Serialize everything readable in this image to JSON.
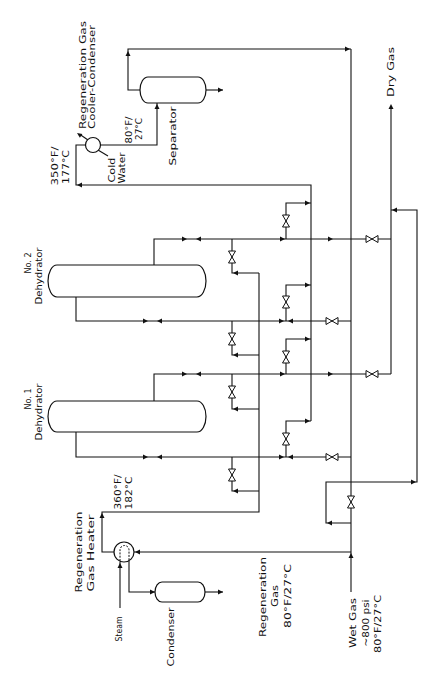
{
  "figure": {
    "background_color": "#ffffff",
    "line_color": "#111111"
  },
  "equipment": {
    "dehydrator_2": {
      "number": "No. 2",
      "name": "Dehydrator"
    },
    "dehydrator_1": {
      "number": "No. 1",
      "name": "Dehydrator"
    },
    "heater": {
      "line1": "Regeneration",
      "line2": "Gas Heater"
    },
    "cooler_condenser": {
      "line1": "Regeneration Gas",
      "line2": "Cooler-Condenser"
    },
    "separator": {
      "label": "Separator"
    },
    "condenser": {
      "label": "Condenser"
    }
  },
  "streams": {
    "wet_gas": {
      "name": "Wet Gas",
      "pressure": "~800 psi",
      "temperature": "80°F/27°C"
    },
    "regeneration_gas": {
      "line1": "Regeneration",
      "line2": "Gas",
      "temperature": "80°F/27°C"
    },
    "dry_gas": {
      "name": "Dry Gas"
    },
    "steam": {
      "name": "Steam"
    },
    "cold_water": {
      "line1": "Cold",
      "line2": "Water"
    }
  },
  "temperatures": {
    "heater_outlet": {
      "f": "360°F/",
      "c": "182°C"
    },
    "cooler_inlet": {
      "f": "350°F/",
      "c": "177°C"
    },
    "cooler_outlet": {
      "f": "80°F/",
      "c": "27°C"
    }
  }
}
